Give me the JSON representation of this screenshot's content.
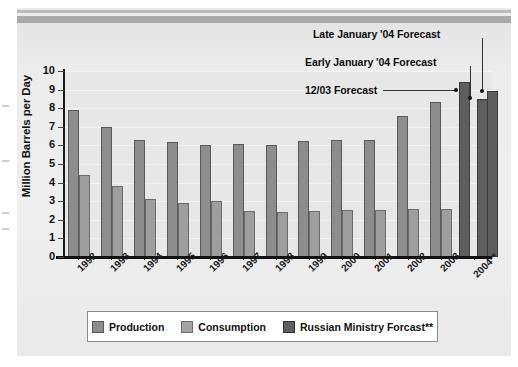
{
  "chart_data": {
    "type": "bar",
    "title": "",
    "xlabel": "",
    "ylabel": "Million Barrels per Day",
    "ylim": [
      0,
      10
    ],
    "ytick_labels": [
      "10",
      "9",
      "8",
      "7",
      "6",
      "5",
      "4",
      "3",
      "2",
      "1",
      "0"
    ],
    "grid": true,
    "legend_position": "bottom",
    "categories": [
      "1992",
      "1993",
      "1994",
      "1995",
      "1996",
      "1997",
      "1998",
      "1999",
      "2000",
      "2001",
      "2002",
      "2003",
      "2004**"
    ],
    "series": [
      {
        "name": "Production",
        "color": "#8d8d8d",
        "values": [
          7.9,
          7.0,
          6.3,
          6.2,
          6.0,
          6.1,
          6.0,
          6.25,
          6.3,
          6.3,
          7.6,
          8.35,
          null
        ]
      },
      {
        "name": "Consumption",
        "color": "#9e9e9e",
        "values": [
          4.4,
          3.8,
          3.1,
          2.9,
          3.0,
          2.5,
          2.4,
          2.5,
          2.55,
          2.55,
          2.6,
          2.6,
          null
        ]
      },
      {
        "name": "Russian Ministry Forcast**",
        "color": "#5e5e5e",
        "values": [
          null,
          null,
          null,
          null,
          null,
          null,
          null,
          null,
          null,
          null,
          null,
          null,
          9.4
        ]
      }
    ],
    "forecast_bars": [
      {
        "label": "12/03 Forecast",
        "value": 9.4
      },
      {
        "label": "Early January '04 Forecast",
        "value": 8.5
      },
      {
        "label": "Late January '04 Forecast",
        "value": 8.9
      }
    ],
    "annotations": [
      {
        "text": "Late January '04 Forecast"
      },
      {
        "text": "Early January '04 Forecast"
      },
      {
        "text": "12/03 Forecast"
      }
    ]
  },
  "axes": {
    "y_title": "Million Barrels per Day",
    "y_ticks": [
      "10",
      "9",
      "8",
      "7",
      "6",
      "5",
      "4",
      "3",
      "2",
      "1",
      "0"
    ],
    "x_ticks": [
      "1992",
      "1993",
      "1994",
      "1995",
      "1996",
      "1997",
      "1998",
      "1999",
      "2000",
      "2001",
      "2002",
      "2003",
      "2004**"
    ]
  },
  "annotations": {
    "late_january": "Late January '04 Forecast",
    "early_january": "Early January '04 Forecast",
    "december_forecast": "12/03 Forecast"
  },
  "legend": {
    "items": [
      {
        "label": "Production",
        "color": "#8d8d8d"
      },
      {
        "label": "Consumption",
        "color": "#9e9e9e"
      },
      {
        "label": "Russian Ministry Forcast**",
        "color": "#5e5e5e"
      }
    ]
  }
}
